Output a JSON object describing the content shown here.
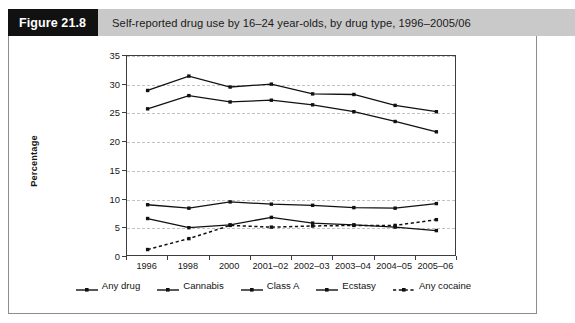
{
  "figure": {
    "number_label": "Figure 21.8",
    "title": "Self-reported drug use by 16–24 year-olds, by drug type, 1996–2005/06"
  },
  "chart_data": {
    "type": "line",
    "title": "Self-reported drug use by 16–24 year-olds, by drug type, 1996–2005/06",
    "xlabel": "",
    "ylabel": "Percentage",
    "ylim": [
      0,
      35
    ],
    "ytick_step": 5,
    "yticks": [
      0,
      5,
      10,
      15,
      20,
      25,
      30,
      35
    ],
    "grid": true,
    "legend_position": "bottom",
    "categories": [
      "1996",
      "1998",
      "2000",
      "2001–02",
      "2002–03",
      "2003–04",
      "2004–05",
      "2005–06"
    ],
    "series": [
      {
        "name": "Any drug",
        "marker": "square",
        "dash": "solid",
        "color": "#111111",
        "values": [
          29.0,
          31.5,
          29.6,
          30.1,
          28.4,
          28.3,
          26.4,
          25.3
        ]
      },
      {
        "name": "Cannabis",
        "marker": "square",
        "dash": "solid",
        "color": "#111111",
        "values": [
          25.8,
          28.1,
          27.0,
          27.3,
          26.5,
          25.3,
          23.6,
          21.8
        ]
      },
      {
        "name": "Class A",
        "marker": "square",
        "dash": "solid",
        "color": "#111111",
        "values": [
          9.1,
          8.5,
          9.6,
          9.2,
          9.0,
          8.6,
          8.5,
          9.3
        ]
      },
      {
        "name": "Ecstasy",
        "marker": "square",
        "dash": "solid",
        "color": "#111111",
        "values": [
          6.7,
          5.1,
          5.6,
          6.9,
          5.9,
          5.6,
          5.2,
          4.6
        ]
      },
      {
        "name": "Any cocaine",
        "marker": "square",
        "dash": "dashed",
        "color": "#111111",
        "values": [
          1.3,
          3.2,
          5.5,
          5.2,
          5.4,
          5.5,
          5.5,
          6.5
        ]
      }
    ]
  },
  "colors": {
    "header_bar": "#c9c9c9",
    "figure_number_bg": "#111111",
    "panel_border": "#8d8d8d",
    "axis": "#3d3d3d",
    "gridline": "#c2c2c2",
    "series": "#111111"
  }
}
